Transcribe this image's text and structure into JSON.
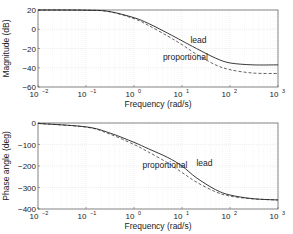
{
  "chart_data": [
    {
      "type": "line",
      "title": "",
      "xlabel": "Frequency (rad/s)",
      "ylabel": "Magnitude (dB)",
      "xscale": "log",
      "xlim": [
        0.01,
        1000
      ],
      "ylim": [
        -60,
        20
      ],
      "xticks": [
        "10^-2",
        "10^-1",
        "10^0",
        "10^1",
        "10^2",
        "10^3"
      ],
      "yticks": [
        20,
        0,
        -20,
        -40,
        -60
      ],
      "grid": true,
      "x": [
        0.01,
        0.1,
        0.3,
        1,
        2,
        5,
        10,
        20,
        50,
        100,
        300,
        1000
      ],
      "series": [
        {
          "name": "lead",
          "style": "solid",
          "values": [
            20,
            19.8,
            18.5,
            12,
            6,
            -4,
            -12,
            -20,
            -30,
            -35,
            -37,
            -37
          ]
        },
        {
          "name": "proportional",
          "style": "dashed",
          "values": [
            20,
            19.8,
            18.3,
            11,
            4,
            -7,
            -16,
            -26,
            -37,
            -42,
            -45.5,
            -46
          ]
        }
      ],
      "annotations": [
        {
          "text": "lead",
          "x": 15,
          "y": -14
        },
        {
          "text": "proportional",
          "x": 4,
          "y": -32
        }
      ]
    },
    {
      "type": "line",
      "title": "",
      "xlabel": "Frequency (rad/s)",
      "ylabel": "Phase angle (deg)",
      "xscale": "log",
      "xlim": [
        0.01,
        1000
      ],
      "ylim": [
        -400,
        0
      ],
      "xticks": [
        "10^-2",
        "10^-1",
        "10^0",
        "10^1",
        "10^2",
        "10^3"
      ],
      "yticks": [
        0,
        -100,
        -200,
        -300,
        -400
      ],
      "grid": true,
      "x": [
        0.01,
        0.1,
        0.3,
        1,
        2,
        5,
        10,
        20,
        50,
        100,
        300,
        1000
      ],
      "series": [
        {
          "name": "lead",
          "style": "solid",
          "values": [
            -2,
            -18,
            -45,
            -90,
            -120,
            -160,
            -200,
            -255,
            -310,
            -335,
            -352,
            -358
          ]
        },
        {
          "name": "proportional",
          "style": "dashed",
          "values": [
            -2,
            -19,
            -50,
            -100,
            -135,
            -185,
            -230,
            -275,
            -320,
            -340,
            -353,
            -358
          ]
        }
      ],
      "annotations": [
        {
          "text": "lead",
          "x": 20,
          "y": -200
        },
        {
          "text": "proportional",
          "x": 1.5,
          "y": -210
        }
      ]
    }
  ],
  "labels": {
    "xlabel": "Frequency (rad/s)",
    "top_ylabel": "Magnitude (dB)",
    "bottom_ylabel": "Phase angle (deg)",
    "lead": "lead",
    "proportional": "proportional"
  }
}
